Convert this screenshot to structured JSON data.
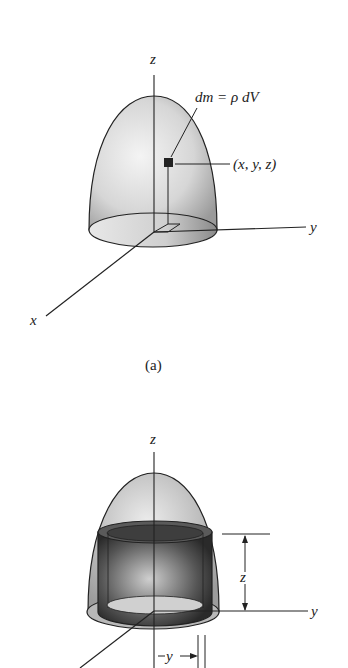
{
  "figure_a": {
    "axis_z": "z",
    "axis_y": "y",
    "axis_x": "x",
    "mass_label": "dm = ρ dV",
    "point_label": "(x, y, z)",
    "caption": "(a)"
  },
  "figure_b": {
    "axis_z": "z",
    "axis_y": "y",
    "dim_z": "z",
    "dim_y": "y"
  }
}
